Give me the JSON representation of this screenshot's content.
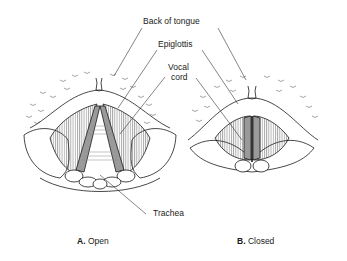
{
  "labels": {
    "back_of_tongue": "Back of tongue",
    "epiglottis": "Epiglottis",
    "vocal_cord_line1": "Vocal",
    "vocal_cord_line2": "cord",
    "trachea": "Trachea"
  },
  "captions": {
    "open": {
      "letter": "A.",
      "text": "Open"
    },
    "closed": {
      "letter": "B.",
      "text": "Closed"
    }
  },
  "colors": {
    "line": "#1a1a1a",
    "cord_fill": "#9a9a9a",
    "background": "#ffffff"
  }
}
